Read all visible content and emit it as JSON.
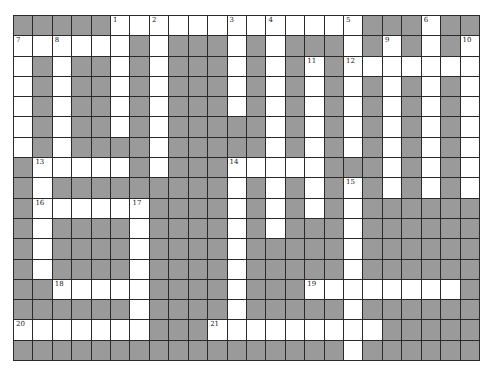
{
  "puzzle": {
    "rows": 17,
    "cols": 24,
    "colors": {
      "white": "#ffffff",
      "block": "#9a9a9a",
      "line": "#2a2a2a"
    },
    "grid": [
      "000001111111111111000100",
      "111111010001010001010101",
      "101001010001010101111111",
      "101001010001010101010101",
      "101001010001010101010101",
      "101001010000010101010101",
      "101000010000010101010101",
      "011111010001111100010101",
      "010000000001010101010101",
      "011111100001010101000000",
      "010000100001010001000000",
      "010000100001000001000000",
      "010000100001000001000000",
      "001111100001000111111110",
      "000000100001000001000000",
      "111111100011111111100000",
      "000000000000000001000000"
    ],
    "numbers": [
      {
        "n": "1",
        "r": 0,
        "c": 5
      },
      {
        "n": "2",
        "r": 0,
        "c": 7
      },
      {
        "n": "3",
        "r": 0,
        "c": 11
      },
      {
        "n": "4",
        "r": 0,
        "c": 13
      },
      {
        "n": "5",
        "r": 0,
        "c": 17
      },
      {
        "n": "6",
        "r": 0,
        "c": 21
      },
      {
        "n": "7",
        "r": 1,
        "c": 0
      },
      {
        "n": "8",
        "r": 1,
        "c": 2
      },
      {
        "n": "9",
        "r": 1,
        "c": 19
      },
      {
        "n": "10",
        "r": 1,
        "c": 23
      },
      {
        "n": "11",
        "r": 2,
        "c": 15
      },
      {
        "n": "12",
        "r": 2,
        "c": 17
      },
      {
        "n": "13",
        "r": 7,
        "c": 1
      },
      {
        "n": "14",
        "r": 7,
        "c": 11
      },
      {
        "n": "15",
        "r": 8,
        "c": 17
      },
      {
        "n": "16",
        "r": 9,
        "c": 1
      },
      {
        "n": "17",
        "r": 9,
        "c": 6
      },
      {
        "n": "18",
        "r": 13,
        "c": 2
      },
      {
        "n": "19",
        "r": 13,
        "c": 15
      },
      {
        "n": "20",
        "r": 15,
        "c": 0
      },
      {
        "n": "21",
        "r": 15,
        "c": 10
      }
    ]
  }
}
